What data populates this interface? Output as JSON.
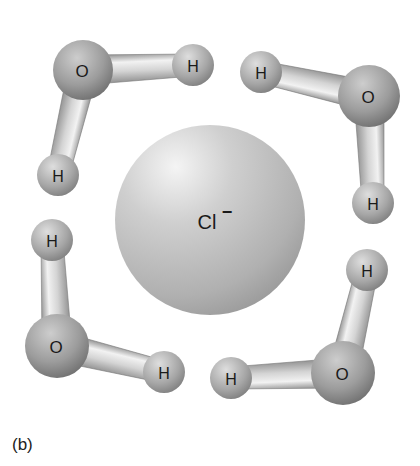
{
  "figure": {
    "caption": "(b)",
    "ion": {
      "label": "Cl",
      "charge": "−",
      "cx": 210,
      "cy": 220,
      "r": 95
    },
    "molecules": [
      {
        "name": "water-top-left",
        "oxygen": {
          "label": "O",
          "cx": 83,
          "cy": 70,
          "r": 30
        },
        "hydrogens": [
          {
            "label": "H",
            "cx": 193,
            "cy": 65,
            "r": 21
          },
          {
            "label": "H",
            "cx": 58,
            "cy": 175,
            "r": 21
          }
        ]
      },
      {
        "name": "water-top-right",
        "oxygen": {
          "label": "O",
          "cx": 369,
          "cy": 96,
          "r": 31
        },
        "hydrogens": [
          {
            "label": "H",
            "cx": 261,
            "cy": 72,
            "r": 21
          },
          {
            "label": "H",
            "cx": 373,
            "cy": 203,
            "r": 21
          }
        ]
      },
      {
        "name": "water-bottom-left",
        "oxygen": {
          "label": "O",
          "cx": 57,
          "cy": 346,
          "r": 32
        },
        "hydrogens": [
          {
            "label": "H",
            "cx": 52,
            "cy": 240,
            "r": 21
          },
          {
            "label": "H",
            "cx": 164,
            "cy": 372,
            "r": 21
          }
        ]
      },
      {
        "name": "water-bottom-right",
        "oxygen": {
          "label": "O",
          "cx": 343,
          "cy": 373,
          "r": 32
        },
        "hydrogens": [
          {
            "label": "H",
            "cx": 367,
            "cy": 270,
            "r": 21
          },
          {
            "label": "H",
            "cx": 231,
            "cy": 378,
            "r": 21
          }
        ]
      }
    ]
  }
}
